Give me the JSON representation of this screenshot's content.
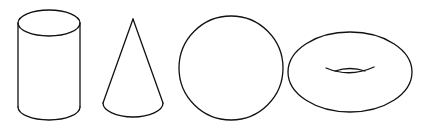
{
  "diagram": {
    "title": "Geometric solids",
    "stroke_color": "#111111",
    "background": "#ffffff",
    "shapes": [
      {
        "name": "Cylinder"
      },
      {
        "name": "Cone"
      },
      {
        "name": "Sphere"
      },
      {
        "name": "Torus"
      }
    ]
  }
}
